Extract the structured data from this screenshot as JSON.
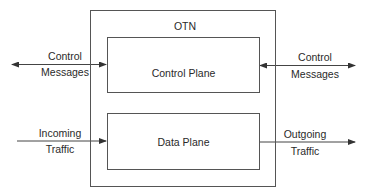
{
  "diagram": {
    "container": {
      "label": "OTN"
    },
    "blocks": [
      {
        "id": "control-plane",
        "label": "Control Plane"
      },
      {
        "id": "data-plane",
        "label": "Data Plane"
      }
    ],
    "edges": [
      {
        "id": "left-control",
        "label_line1": "Control",
        "label_line2": "Messages",
        "direction": "bidirectional",
        "target": "control-plane"
      },
      {
        "id": "right-control",
        "label_line1": "Control",
        "label_line2": "Messages",
        "direction": "bidirectional",
        "target": "control-plane"
      },
      {
        "id": "incoming",
        "label_line1": "Incoming",
        "label_line2": "Traffic",
        "direction": "into",
        "target": "data-plane"
      },
      {
        "id": "outgoing",
        "label_line1": "Outgoing",
        "label_line2": "Traffic",
        "direction": "out-of",
        "target": "data-plane"
      }
    ]
  }
}
